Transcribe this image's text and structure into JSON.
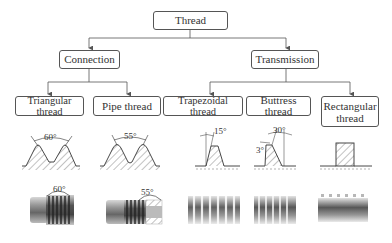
{
  "root": {
    "label": "Thread"
  },
  "categories": [
    {
      "label": "Connection"
    },
    {
      "label": "Transmission"
    }
  ],
  "types": [
    {
      "label": "Triangular thread",
      "angle": "60°",
      "category": "Connection"
    },
    {
      "label": "Pipe thread",
      "angle": "55°",
      "category": "Connection"
    },
    {
      "label": "Trapezoidal thread",
      "angle": "15°",
      "category": "Transmission"
    },
    {
      "label": "Buttress thread",
      "angle": "30°",
      "angle2": "3°",
      "category": "Transmission"
    },
    {
      "label": "Rectangular thread",
      "line1": "Rectangular",
      "line2": "thread",
      "category": "Transmission"
    }
  ],
  "photos": [
    {
      "angle": "60°"
    },
    {
      "angle": "55°"
    }
  ],
  "colors": {
    "line": "#555555",
    "text": "#333333"
  }
}
